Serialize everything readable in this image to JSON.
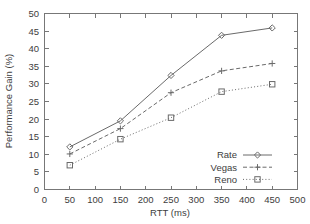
{
  "chart_data": {
    "type": "line",
    "title": "",
    "xlabel": "RTT (ms)",
    "ylabel": "Performance Gain (%)",
    "xlim": [
      0,
      500
    ],
    "ylim": [
      0,
      50
    ],
    "xticks": [
      0,
      50,
      100,
      150,
      200,
      250,
      300,
      350,
      400,
      450,
      500
    ],
    "yticks": [
      0,
      5,
      10,
      15,
      20,
      25,
      30,
      35,
      40,
      45,
      50
    ],
    "grid": false,
    "legend_position": "lower-right-inside",
    "x": [
      50,
      150,
      250,
      350,
      450
    ],
    "series": [
      {
        "name": "Rate",
        "marker": "diamond",
        "linestyle": "solid",
        "color": "#6a6a6a",
        "values": [
          12.1,
          19.5,
          32.4,
          43.8,
          45.9
        ]
      },
      {
        "name": "Vegas",
        "marker": "plus",
        "linestyle": "dashed",
        "color": "#6a6a6a",
        "values": [
          10.1,
          17.3,
          27.5,
          33.7,
          35.8
        ]
      },
      {
        "name": "Reno",
        "marker": "square",
        "linestyle": "dotted",
        "color": "#6a6a6a",
        "values": [
          6.9,
          14.3,
          20.4,
          27.8,
          29.9
        ]
      }
    ]
  },
  "axes": {
    "x_tick_labels": [
      "0",
      "50",
      "100",
      "150",
      "200",
      "250",
      "300",
      "350",
      "400",
      "450",
      "500"
    ],
    "y_tick_labels": [
      "0",
      "5",
      "10",
      "15",
      "20",
      "25",
      "30",
      "35",
      "40",
      "45",
      "50"
    ],
    "x_axis_title": "RTT (ms)",
    "y_axis_title": "Performance Gain (%)"
  },
  "legend": {
    "entries": [
      {
        "label": "Rate"
      },
      {
        "label": "Vegas"
      },
      {
        "label": "Reno"
      }
    ]
  }
}
